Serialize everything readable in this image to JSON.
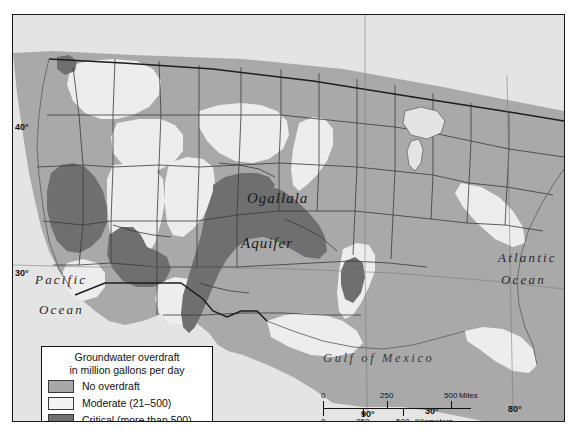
{
  "map": {
    "title_area": "Groundwater overdraft map of the western and central United States",
    "place_labels": [
      {
        "name": "ogallala",
        "text": "Ogallala",
        "x": 246,
        "y": 183
      },
      {
        "name": "aquifer",
        "text": "Aquifer",
        "x": 240,
        "y": 228
      },
      {
        "name": "pacific-ocean-line1",
        "text": "Pacific",
        "x": 33,
        "y": 265
      },
      {
        "name": "pacific-ocean-line2",
        "text": "Ocean",
        "x": 37,
        "y": 295
      },
      {
        "name": "atlantic-ocean-line1",
        "text": "Atlantic",
        "x": 497,
        "y": 243
      },
      {
        "name": "atlantic-ocean-line2",
        "text": "Ocean",
        "x": 500,
        "y": 265
      },
      {
        "name": "gulf-of-mexico",
        "text": "Gulf of Mexico",
        "x": 322,
        "y": 344
      }
    ],
    "coordinates": [
      {
        "name": "lat-40",
        "text": "40°",
        "x": 14,
        "y": 122
      },
      {
        "name": "lat-30",
        "text": "30°",
        "x": 14,
        "y": 268
      },
      {
        "name": "lon-90",
        "text": "90°",
        "x": 360,
        "y": 411
      },
      {
        "name": "lon-80",
        "text": "80°",
        "x": 508,
        "y": 406
      },
      {
        "name": "lon-30-inset",
        "text": "30°",
        "x": 424,
        "y": 408
      }
    ],
    "colors": {
      "no_overdraft": "#a8a8a8",
      "moderate": "#ececec",
      "critical": "#707070",
      "ocean": "#e4e4e4",
      "land_base": "#d5d5d5",
      "border_line": "#333333",
      "frame": "#1a1a1a"
    }
  },
  "legend": {
    "title_line1": "Groundwater overdraft",
    "title_line2": "in million gallons per day",
    "items": [
      {
        "label": "No overdraft",
        "color": "#a8a8a8"
      },
      {
        "label": "Moderate (21–500)",
        "color": "#f2f2f2"
      },
      {
        "label": "Critical (more than 500)",
        "color": "#707070"
      }
    ]
  },
  "scalebar": {
    "miles_ticks": [
      "0",
      "250",
      "500"
    ],
    "miles_unit": "Miles",
    "km_ticks": [
      "0",
      "250",
      "500"
    ],
    "km_unit": "Kilometers"
  }
}
